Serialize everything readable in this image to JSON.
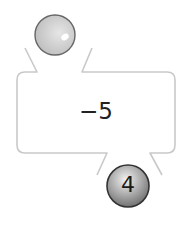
{
  "machine": {
    "operation": "−5",
    "input_ball": {
      "label": "",
      "color": "#c8c8c8"
    },
    "output_ball": {
      "label": "4",
      "color": "#8a8a8a"
    },
    "frame_color": "#c9c9c9"
  }
}
